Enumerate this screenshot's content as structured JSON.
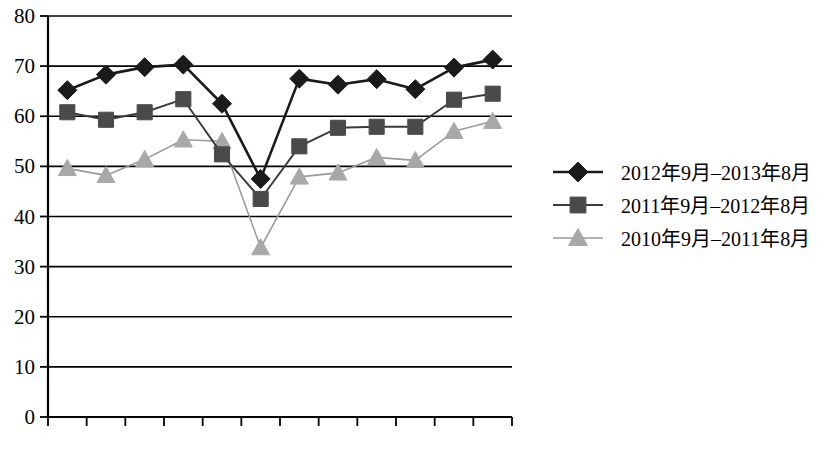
{
  "chart_data": {
    "type": "line",
    "title": "",
    "subtitle": "",
    "xlabel": "",
    "ylabel": "",
    "ylim": [
      0,
      80
    ],
    "ytick_step": 10,
    "yticks": [
      "0",
      "10",
      "20",
      "30",
      "40",
      "50",
      "60",
      "70",
      "80"
    ],
    "grid": true,
    "legend_position": "right",
    "categories": [
      "9月",
      "10月",
      "11月",
      "12月",
      "1月",
      "2月",
      "3月",
      "4月",
      "5月",
      "6月",
      "7月",
      "8月"
    ],
    "series": [
      {
        "name": "2012年9月–2013年8月",
        "marker": "diamond",
        "color": "#1a1a1a",
        "line_color": "#1a1a1a",
        "values": [
          65.2,
          68.3,
          69.8,
          70.3,
          62.5,
          47.5,
          67.5,
          66.3,
          67.4,
          65.4,
          69.7,
          71.3
        ]
      },
      {
        "name": "2011年9月–2012年8月",
        "marker": "square",
        "color": "#4a4a4a",
        "line_color": "#3a3a3a",
        "values": [
          60.8,
          59.3,
          60.8,
          63.4,
          52.4,
          43.5,
          54.0,
          57.7,
          57.9,
          57.9,
          63.3,
          64.5
        ]
      },
      {
        "name": "2010年9月–2011年8月",
        "marker": "triangle",
        "color": "#a8a8a8",
        "line_color": "#9a9a9a",
        "values": [
          49.6,
          48.2,
          51.4,
          55.3,
          55.0,
          33.8,
          47.9,
          48.7,
          51.8,
          51.2,
          57.0,
          59.0
        ]
      }
    ]
  },
  "legend": {
    "entries": [
      {
        "label": "2012年9月–2013年8月",
        "marker": "diamond-marker"
      },
      {
        "label": "2011年9月–2012年8月",
        "marker": "square-marker"
      },
      {
        "label": "2010年9月–2011年8月",
        "marker": "triangle-marker"
      }
    ]
  }
}
